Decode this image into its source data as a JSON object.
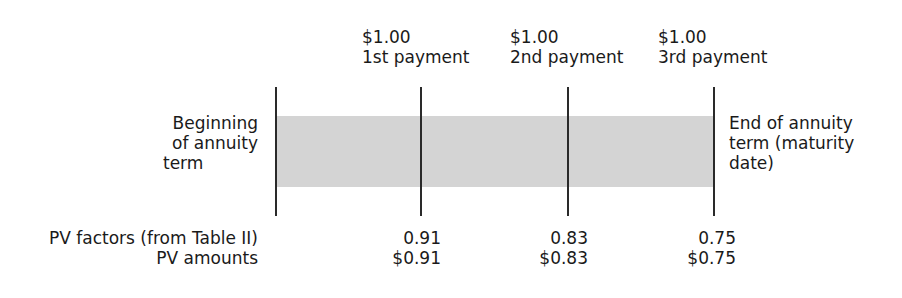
{
  "payments": [
    {
      "amount": "$1.00",
      "label": "1st payment",
      "pv_factor": "0.91",
      "pv_amount": "$0.91"
    },
    {
      "amount": "$1.00",
      "label": "2nd payment",
      "pv_factor": "0.83",
      "pv_amount": "$0.83"
    },
    {
      "amount": "$1.00",
      "label": "3rd payment",
      "pv_factor": "0.75",
      "pv_amount": "$0.75"
    }
  ],
  "start_label": [
    "Beginning",
    "of annuity",
    "term"
  ],
  "end_label": [
    "End of annuity",
    "term (maturity",
    "date)"
  ],
  "row_labels": {
    "pv_factors": "PV factors (from Table II)",
    "pv_amounts": "PV amounts"
  },
  "colors": {
    "band": "#d4d4d4",
    "line": "#2a2a2a",
    "text": "#1a1a1a"
  }
}
